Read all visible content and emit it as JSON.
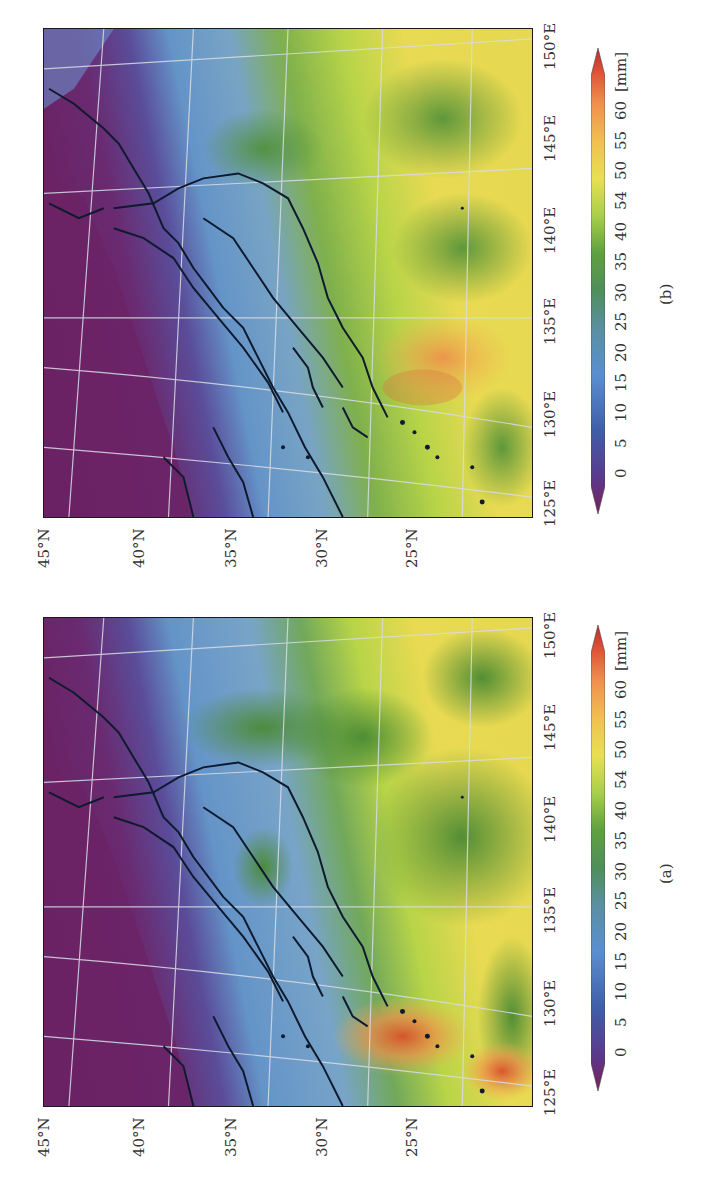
{
  "figure": {
    "orientation": "rotated -90deg (landscape page shown in portrait)",
    "panels": [
      {
        "id": "b",
        "caption": "(b)",
        "lat_labels": [
          "45°N",
          "40°N",
          "35°N",
          "30°N",
          "25°N"
        ],
        "lon_labels": [
          "125°E",
          "130°E",
          "135°E",
          "140°E",
          "145°E",
          "150°E"
        ],
        "colorbar": {
          "ticks": [
            "0",
            "5",
            "10",
            "15",
            "20",
            "25",
            "30",
            "35",
            "40",
            "54",
            "50",
            "55",
            "60"
          ],
          "unit": "[mm]"
        }
      },
      {
        "id": "a",
        "caption": "(a)",
        "lat_labels": [
          "45°N",
          "40°N",
          "35°N",
          "30°N",
          "25°N"
        ],
        "lon_labels": [
          "125°E",
          "130°E",
          "135°E",
          "140°E",
          "145°E",
          "150°E"
        ],
        "colorbar": {
          "ticks": [
            "0",
            "5",
            "10",
            "15",
            "20",
            "25",
            "30",
            "35",
            "40",
            "54",
            "50",
            "55",
            "60"
          ],
          "unit": "[mm]"
        }
      }
    ],
    "colormap": {
      "name": "precipitable water",
      "stops": [
        "#7a1f5c",
        "#5a3a8c",
        "#3f5fa8",
        "#5b8fd0",
        "#6fa0c8",
        "#4f8f5a",
        "#5fa040",
        "#a8cf4a",
        "#e8e050",
        "#f0c050",
        "#f09050",
        "#e05a3a",
        "#c02a2a"
      ]
    },
    "colors": {
      "frame": "#1a1a1a",
      "coastline": "#0e1a2e",
      "graticule": "#d8dde6",
      "text": "#333333"
    }
  }
}
